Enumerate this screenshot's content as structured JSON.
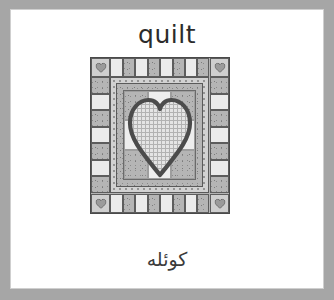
{
  "card": {
    "headword": "quilt",
    "translation": "كوئلە",
    "border_color": "#a6a6a6",
    "background_color": "#ffffff",
    "text_color": "#2b2b2b"
  },
  "illustration": {
    "name": "quilt-illustration",
    "description": "patchwork quilt with pieced outer border, corner heart blocks and a large appliqued gingham heart in the centre panel",
    "palette": {
      "outline": "#4a4a4a",
      "light_fabric": "#ebebeb",
      "mid_fabric": "#b9b9b9",
      "dark_fabric": "#9a9a9a",
      "print_fabric": "#b5b5b5",
      "check_fabric": "#e2e2e2",
      "heart_outline": "#4b4b4b"
    },
    "border": {
      "top_cells": [
        "light",
        "mid",
        "light",
        "mid",
        "light",
        "mid",
        "light",
        "mid"
      ],
      "bottom_cells": [
        "light",
        "mid",
        "light",
        "mid",
        "light",
        "mid",
        "light",
        "mid"
      ],
      "left_cells": [
        "mid",
        "light",
        "mid",
        "light",
        "mid",
        "light",
        "mid"
      ],
      "right_cells": [
        "mid",
        "light",
        "mid",
        "light",
        "mid",
        "light",
        "mid"
      ],
      "corner_block_label": "heart block"
    },
    "center_panel": {
      "patches": [
        [
          "print",
          "light",
          "print"
        ],
        [
          "light",
          "print",
          "light"
        ],
        [
          "print",
          "light",
          "print"
        ]
      ],
      "motif": "heart"
    }
  }
}
